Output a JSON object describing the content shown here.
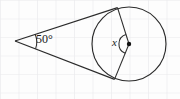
{
  "figure": {
    "background": {
      "paper_color": "#fdfdfd",
      "grid_color": "#e9e9ec",
      "grid_spacing_px": 18.5,
      "grid_visible": true
    },
    "stroke_color": "#2b2b2b",
    "labels": {
      "exterior_angle": "50°",
      "central_angle": "x"
    },
    "geometry": {
      "circle": {
        "cx": 129,
        "cy": 44,
        "r": 37
      },
      "center_dot": {
        "cx": 129,
        "cy": 44,
        "r": 2.2
      },
      "vertex": {
        "x": 15,
        "y": 41
      },
      "tangent_point_upper": {
        "x": 117.5,
        "y": 7.6
      },
      "tangent_point_lower": {
        "x": 114.5,
        "y": 79.4
      },
      "exterior_arc": {
        "cx": 15,
        "cy": 41,
        "r": 21
      },
      "central_arc": {
        "cx": 129,
        "cy": 44,
        "r": 10
      }
    }
  }
}
